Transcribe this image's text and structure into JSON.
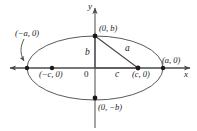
{
  "figure": {
    "background_color": "#ffffff",
    "stroke_color": "#4a4a4a",
    "text_color": "#1a1a1a"
  },
  "axes": {
    "x_label": "x",
    "y_label": "y",
    "origin_label": "0"
  },
  "points": {
    "top_covertex": "(0, b)",
    "bottom_covertex": "(0, −b)",
    "right_vertex": "(a, 0)",
    "left_vertex": "(−a, 0)",
    "right_focus": "(c, 0)",
    "left_focus": "(−c, 0)"
  },
  "segments": {
    "semi_minor": "b",
    "focal_radius": "a",
    "focal_distance": "c"
  },
  "geometry": {
    "origin_x": 95,
    "origin_y": 68,
    "semi_major_px": 68,
    "semi_minor_px": 32,
    "focus_px": 43
  }
}
